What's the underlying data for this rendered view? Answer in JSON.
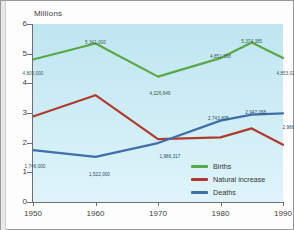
{
  "chart_data": {
    "type": "line",
    "title": "Millions",
    "xlabel": "",
    "ylabel": "Millions",
    "x": [
      1950,
      1960,
      1970,
      1980,
      1985,
      1990
    ],
    "xticks": [
      "1950",
      "1960",
      "1970",
      "1980",
      "1990"
    ],
    "yticks": [
      "0",
      "1",
      "2",
      "3",
      "4",
      "5",
      "6"
    ],
    "ylim": [
      0,
      6
    ],
    "xlim": [
      1950,
      1990
    ],
    "grid": false,
    "legend_position": "bottom-right",
    "series": [
      {
        "name": "Births",
        "color": "#5aa845",
        "values": [
          4805000,
          5341000,
          4226649,
          4851368,
          5374385,
          4853029
        ],
        "labels": [
          "4,805,000",
          "5,341,000",
          "4,226,649",
          "4,851,368",
          "5,374,385",
          "4,853,029"
        ]
      },
      {
        "name": "Natural increase",
        "color": "#b03a2e",
        "values": [
          2880000,
          3600000,
          2120000,
          2180000,
          2480000,
          1930000
        ],
        "labels": [
          "",
          "",
          "1,986,317",
          "",
          "",
          ""
        ]
      },
      {
        "name": "Deaths",
        "color": "#3f6fa8",
        "values": [
          1746000,
          1522000,
          1986317,
          2743805,
          2947068,
          2986158
        ],
        "labels": [
          "1,746,000",
          "1,522,000",
          "",
          "2,743,805",
          "2,947,068",
          "2,986,158"
        ]
      }
    ]
  },
  "legend": {
    "items": [
      {
        "label": "Births",
        "color": "#5aa845"
      },
      {
        "label": "Natural increase",
        "color": "#b03a2e"
      },
      {
        "label": "Deaths",
        "color": "#3f6fa8"
      }
    ]
  },
  "colors": {
    "plot_background": "#c9eaf3",
    "axis": "#6f6f6f",
    "page_background": "#fdfdfd"
  }
}
